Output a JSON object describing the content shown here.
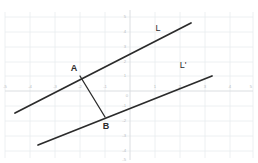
{
  "figure": {
    "kind": "coordinate-plane-geometry",
    "background_color": "#ffffff",
    "line_color": "#2b2b2b",
    "grid_color": "#e9ecef",
    "axis_color": "#d7dade",
    "tick_label_color": "#b9bdc2"
  },
  "axes": {
    "x_label_text": "",
    "y_label_text": "",
    "x_ticks": [
      "-5",
      "-4",
      "-3",
      "-2",
      "-1",
      "0",
      "1",
      "2",
      "3",
      "4",
      "5"
    ],
    "y_ticks": [
      "5",
      "4",
      "3",
      "2",
      "1",
      "-1",
      "-2",
      "-3",
      "-4",
      "-5"
    ],
    "x_range": [
      -5,
      5
    ],
    "y_range": [
      -5,
      5
    ],
    "origin_label": "0",
    "grid_visible": true
  },
  "points": [
    {
      "name": "A",
      "label": "A",
      "x": -2,
      "y": 1
    },
    {
      "name": "B",
      "label": "B",
      "x": -1,
      "y": -1
    }
  ],
  "lines": [
    {
      "name": "L",
      "label": "L",
      "through": [
        -2,
        1
      ],
      "slope": 0.7,
      "x_start": -4.6,
      "x_end": 2.45,
      "label_x": 1.05,
      "label_y": 3.05
    },
    {
      "name": "L-prime",
      "label": "L'",
      "through": [
        -1,
        -1
      ],
      "slope": 0.7,
      "x_start": -4.1,
      "x_end": 3.25,
      "label_x": 2.0,
      "label_y": 1.35
    }
  ],
  "segments": [
    {
      "name": "AB",
      "from": "A",
      "to": "B"
    }
  ]
}
